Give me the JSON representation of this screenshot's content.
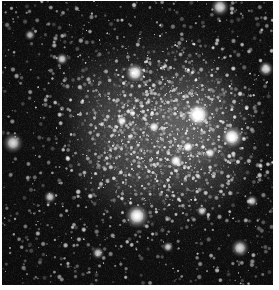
{
  "image": {
    "kind": "astronomical-photograph",
    "subject": "dense star cluster field",
    "color_mode": "grayscale",
    "alt_text": "Grayscale astronomical photograph of a densely populated star cluster against a starry background field",
    "canvas_width": 279,
    "canvas_height": 290,
    "plate": {
      "left": 2,
      "top": 1,
      "width": 271,
      "height": 284
    },
    "page_background": "#ffffff",
    "sky_background": "#0d0d0d",
    "star_color": "#ffffff",
    "glow_color": "#9a9a9a",
    "caption": ""
  },
  "chart_data": {
    "type": "scatter",
    "title": "",
    "xlabel": "",
    "ylabel": "",
    "xlim": [
      0,
      271
    ],
    "ylim": [
      0,
      284
    ],
    "grid": false,
    "legend": null,
    "background": "#0d0d0d",
    "noise": {
      "grain_amplitude": 26,
      "base_level": 13,
      "seed": 20240517
    },
    "diffuse_glow": [
      {
        "cx": 160,
        "cy": 128,
        "r": 112,
        "peak": 44,
        "note": "main cluster halo"
      },
      {
        "cx": 196,
        "cy": 114,
        "r": 60,
        "peak": 34,
        "note": "inner core brightening"
      },
      {
        "cx": 132,
        "cy": 150,
        "r": 78,
        "peak": 22,
        "note": "western cluster extension"
      },
      {
        "cx": 205,
        "cy": 165,
        "r": 52,
        "peak": 18,
        "note": "southeast lobe"
      },
      {
        "cx": 96,
        "cy": 96,
        "r": 56,
        "peak": 14,
        "note": "northwest haze"
      }
    ],
    "star_field": {
      "count": 2600,
      "radius_range": [
        0.5,
        2.0
      ],
      "brightness_range": [
        70,
        215
      ],
      "concentration_center": [
        160,
        130
      ],
      "concentration_strength": 0.55
    },
    "bright_stars": [
      {
        "x": 196,
        "y": 114,
        "r": 7.5,
        "b": 255,
        "halo": 22,
        "name": "brightest-star-core"
      },
      {
        "x": 230,
        "y": 136,
        "r": 6.0,
        "b": 252,
        "halo": 19,
        "name": "bright-star-east"
      },
      {
        "x": 135,
        "y": 215,
        "r": 6.2,
        "b": 250,
        "halo": 18,
        "name": "bright-star-south"
      },
      {
        "x": 133,
        "y": 72,
        "r": 5.4,
        "b": 238,
        "halo": 16,
        "name": "fuzzy-star-north"
      },
      {
        "x": 11,
        "y": 142,
        "r": 5.0,
        "b": 244,
        "halo": 15,
        "name": "bright-star-west-edge"
      },
      {
        "x": 238,
        "y": 247,
        "r": 4.6,
        "b": 240,
        "halo": 13,
        "name": "bright-star-southeast"
      },
      {
        "x": 218,
        "y": 6,
        "r": 4.8,
        "b": 238,
        "halo": 13,
        "name": "bright-star-north-edge"
      },
      {
        "x": 264,
        "y": 68,
        "r": 4.0,
        "b": 230,
        "halo": 11,
        "name": "bright-star-northeast-edge"
      },
      {
        "x": 174,
        "y": 160,
        "r": 4.2,
        "b": 236,
        "halo": 12,
        "name": "cluster-member-bright-a"
      },
      {
        "x": 186,
        "y": 146,
        "r": 3.8,
        "b": 232,
        "halo": 11,
        "name": "cluster-member-bright-b"
      },
      {
        "x": 152,
        "y": 126,
        "r": 3.6,
        "b": 228,
        "halo": 10,
        "name": "cluster-member-bright-c"
      },
      {
        "x": 208,
        "y": 152,
        "r": 3.4,
        "b": 226,
        "halo": 10,
        "name": "cluster-member-bright-d"
      },
      {
        "x": 120,
        "y": 120,
        "r": 3.4,
        "b": 224,
        "halo": 10,
        "name": "cluster-member-bright-e"
      },
      {
        "x": 60,
        "y": 58,
        "r": 3.2,
        "b": 222,
        "halo": 9,
        "name": "field-star-northwest"
      },
      {
        "x": 48,
        "y": 196,
        "r": 3.2,
        "b": 220,
        "halo": 9,
        "name": "field-star-southwest"
      },
      {
        "x": 96,
        "y": 252,
        "r": 3.2,
        "b": 222,
        "halo": 9,
        "name": "field-star-south"
      },
      {
        "x": 250,
        "y": 200,
        "r": 3.0,
        "b": 218,
        "halo": 9,
        "name": "field-star-east"
      },
      {
        "x": 28,
        "y": 34,
        "r": 2.8,
        "b": 214,
        "halo": 8,
        "name": "field-star-north-west"
      },
      {
        "x": 166,
        "y": 246,
        "r": 2.8,
        "b": 214,
        "halo": 8,
        "name": "field-star-south-center"
      },
      {
        "x": 200,
        "y": 210,
        "r": 2.8,
        "b": 212,
        "halo": 8,
        "name": "field-star-southeast-inner"
      }
    ]
  }
}
